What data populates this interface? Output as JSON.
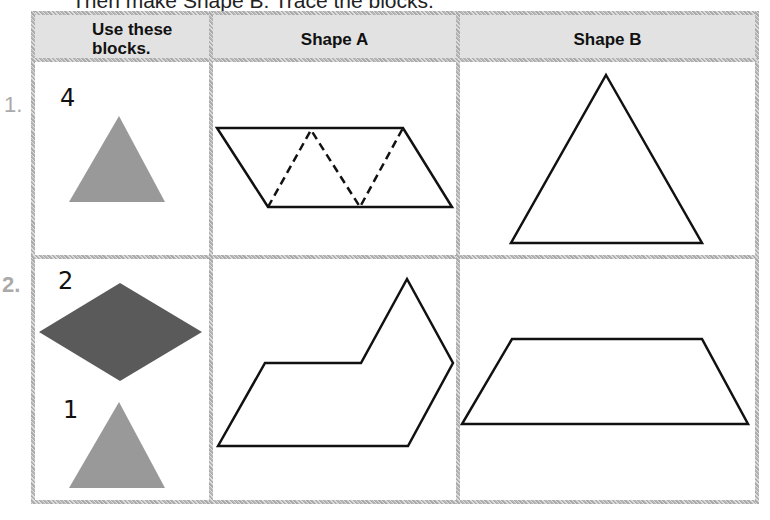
{
  "instruction": "Then make Shape B. Trace the blocks.",
  "headers": {
    "blocks": "Use these blocks.",
    "blocks_line1": "Use these",
    "blocks_line2": "blocks.",
    "shape_a": "Shape A",
    "shape_b": "Shape B"
  },
  "rows": [
    {
      "number": "1.",
      "blocks": [
        {
          "count": "4",
          "shape": "triangle",
          "color": "#999999"
        }
      ],
      "shape_a": "parallelogram made of 4 triangles (dashed dividers)",
      "shape_b": "large triangle"
    },
    {
      "number": "2.",
      "blocks": [
        {
          "count": "2",
          "shape": "rhombus",
          "color": "#5a5a5a"
        },
        {
          "count": "1",
          "shape": "triangle",
          "color": "#999999"
        }
      ],
      "shape_a": "hexagon-like irregular shape",
      "shape_b": "trapezoid"
    }
  ],
  "colors": {
    "header_bg": "#e2e2e2",
    "border": "#c0c0c0",
    "triangle_block": "#999999",
    "rhombus_block": "#5a5a5a",
    "outline": "#111111"
  }
}
